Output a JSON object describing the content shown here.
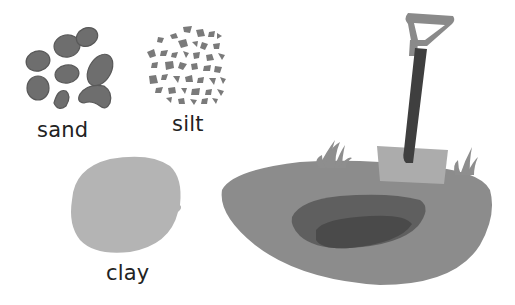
{
  "labels": {
    "sand": "sand",
    "silt": "silt",
    "clay": "clay"
  },
  "icons": [
    "sand-pebbles-icon",
    "silt-particles-icon",
    "clay-blob-icon",
    "shovel-icon",
    "soil-hole-icon",
    "grass-icon"
  ],
  "colors": {
    "background": "#ffffff",
    "pebble": "#6e6e6e",
    "pebble_dark": "#555555",
    "silt": "#7a7a7a",
    "clay": "#b4b4b4",
    "ground": "#8c8c8c",
    "hole_outer": "#5f5f5f",
    "hole_inner": "#4a4a4a",
    "shovel_handle": "#3f3f3f",
    "shovel_grip": "#8a8a8a",
    "shovel_blade": "#acacac",
    "grass": "#8e8e8e",
    "text": "#222222"
  }
}
